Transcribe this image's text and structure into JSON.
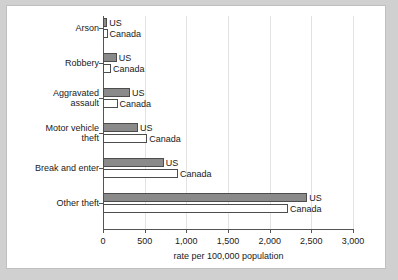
{
  "chart_data": {
    "type": "bar",
    "orientation": "horizontal",
    "title": "",
    "xlabel": "rate per 100,000 population",
    "ylabel": "",
    "xlim": [
      0,
      3000
    ],
    "xticks": [
      0,
      500,
      1000,
      1500,
      2000,
      2500,
      3000
    ],
    "xtick_labels": [
      "0",
      "500",
      "1,000",
      "1,500",
      "2,000",
      "2,500",
      "3,000"
    ],
    "grid": true,
    "grid_axis": "x",
    "legend": "inline-series-labels",
    "categories": [
      "Arson",
      "Robbery",
      "Aggravated\nassault",
      "Motor vehicle\ntheft",
      "Break and enter",
      "Other theft"
    ],
    "series": [
      {
        "name": "US",
        "color": "#8a8a8a",
        "values": [
          50,
          165,
          325,
          420,
          730,
          2450
        ]
      },
      {
        "name": "Canada",
        "color": "#ffffff",
        "values": [
          55,
          95,
          175,
          530,
          900,
          2220
        ]
      }
    ]
  },
  "colors": {
    "page_background": "#cfd0cf",
    "figure_background": "#ffffff",
    "figure_border": "#bfc0bf",
    "axis": "#555555",
    "gridline": "#e2e2e2",
    "text": "#1a1a1a",
    "us_bar_fill": "#8a8a8a",
    "canada_bar_fill": "#ffffff",
    "bar_stroke": "#4d4d4d"
  }
}
